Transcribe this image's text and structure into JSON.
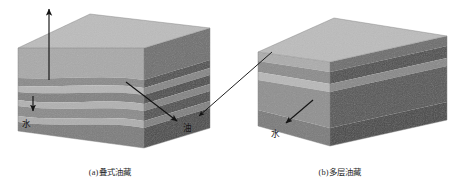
{
  "figure": {
    "background_color": "#ffffff",
    "panels": [
      {
        "id": "panel-a",
        "caption": "(a)叠式油藏",
        "caption_x": 110,
        "caption_y": 175,
        "block": {
          "type": "isometric-block-diagram",
          "origin_x": 18,
          "origin_y": 20,
          "top_face_color": "#b9b9b9",
          "front_face_base_color": "#9d9d9d",
          "side_face_base_color": "#6f6f6f",
          "outline_color": "#6a6a6a",
          "width": 160,
          "depth": 62,
          "height": 78,
          "layer_count": 8,
          "description": "Stacked reservoir block with many thin alternating oil and water bearing strata"
        },
        "layers": [
          {
            "name": "caprock",
            "front_color": "#a9a9a9",
            "side_color": "#767676",
            "thickness": 0.26
          },
          {
            "name": "oil-band-1",
            "front_color": "#8a8a8a",
            "side_color": "#5c5c5c",
            "thickness": 0.09
          },
          {
            "name": "water-band-1",
            "front_color": "#b3b3b3",
            "side_color": "#7f7f7f",
            "thickness": 0.07
          },
          {
            "name": "oil-band-2",
            "front_color": "#7e7e7e",
            "side_color": "#525252",
            "thickness": 0.11
          },
          {
            "name": "water-band-2",
            "front_color": "#b0b0b0",
            "side_color": "#7c7c7c",
            "thickness": 0.07
          },
          {
            "name": "oil-band-3",
            "front_color": "#8a8a8a",
            "side_color": "#5a5a5a",
            "thickness": 0.11
          },
          {
            "name": "water-band-3",
            "front_color": "#adadad",
            "side_color": "#797979",
            "thickness": 0.08
          },
          {
            "name": "oil-band-4",
            "front_color": "#7c7c7c",
            "side_color": "#4f4f4f",
            "thickness": 0.21
          }
        ],
        "annotations": [
          {
            "id": "well-arrow",
            "label": "",
            "kind": "vertical-well-arrow",
            "x": 49,
            "y_top": 7,
            "y_bottom": 80,
            "arrowhead": "up",
            "color": "#141414"
          },
          {
            "id": "water-arrow-a",
            "label": "水",
            "label_x": 22,
            "label_y": 125,
            "kind": "short-arrow",
            "x1": 33,
            "y1": 96,
            "x2": 33,
            "y2": 113,
            "arrowhead": "down",
            "color": "#141414"
          },
          {
            "id": "oil-arrow-a",
            "label": "油",
            "label_x": 185,
            "label_y": 131,
            "kind": "diagonal-arrow",
            "x1": 126,
            "y1": 82,
            "x2": 179,
            "y2": 123,
            "arrowhead": "end",
            "color": "#141414"
          }
        ]
      },
      {
        "id": "panel-b",
        "caption": "(b)多层油藏",
        "caption_x": 340,
        "caption_y": 175,
        "block": {
          "type": "isometric-block-diagram",
          "origin_x": 258,
          "origin_y": 22,
          "top_face_color": "#b9b9b9",
          "front_face_base_color": "#9d9d9d",
          "side_face_base_color": "#6f6f6f",
          "outline_color": "#6a6a6a",
          "width": 162,
          "depth": 62,
          "height": 76,
          "layer_count": 5,
          "description": "Multi-layer reservoir block with few thick alternating oil and water bearing strata"
        },
        "layers": [
          {
            "name": "caprock",
            "front_color": "#aaaaaa",
            "side_color": "#6e6e6e",
            "thickness": 0.12
          },
          {
            "name": "oil-layer-1",
            "front_color": "#8c8c8c",
            "side_color": "#5a5a5a",
            "thickness": 0.2
          },
          {
            "name": "water-layer",
            "front_color": "#b4b4b4",
            "side_color": "#818181",
            "thickness": 0.1
          },
          {
            "name": "oil-layer-2",
            "front_color": "#8e8e8e",
            "side_color": "#5d5d5d",
            "thickness": 0.38
          },
          {
            "name": "oil-layer-3",
            "front_color": "#7a7a7a",
            "side_color": "#4d4d4d",
            "thickness": 0.2
          }
        ],
        "annotations": [
          {
            "id": "oil-arrow-b",
            "label": "",
            "kind": "long-diagonal-arrow",
            "x1": 196,
            "y1": 118,
            "x2": 272,
            "y2": 52,
            "arrowhead": "start",
            "color": "#141414"
          },
          {
            "id": "water-arrow-b",
            "label": "水",
            "label_x": 272,
            "label_y": 137,
            "kind": "diagonal-arrow",
            "x1": 313,
            "y1": 100,
            "x2": 284,
            "y2": 125,
            "arrowhead": "end",
            "color": "#141414"
          }
        ]
      }
    ],
    "labels": {
      "water": "水",
      "oil": "油"
    }
  }
}
